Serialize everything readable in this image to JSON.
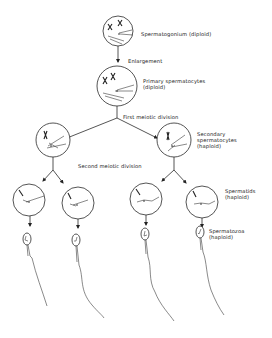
{
  "stages": {
    "spermatogonium": {
      "label": "Spermatogonium (diploid)"
    },
    "enlargement": {
      "label": "Enlargement"
    },
    "primary": {
      "line1": "Primary spermatocytes",
      "line2": "(diploid)"
    },
    "first_division": {
      "label": "First meiotic division"
    },
    "secondary": {
      "line1": "Secondary",
      "line2": "spermatocytes",
      "line3": "(haploid)"
    },
    "second_division": {
      "label": "Second meiotic division"
    },
    "spermatids": {
      "line1": "Spermatids",
      "line2": "(haploid)"
    },
    "spermatozoa": {
      "line1": "Spermatozoa",
      "line2": "(haploid)"
    }
  },
  "colors": {
    "line": "#2a2a2a",
    "background": "#ffffff",
    "text": "#222222"
  }
}
